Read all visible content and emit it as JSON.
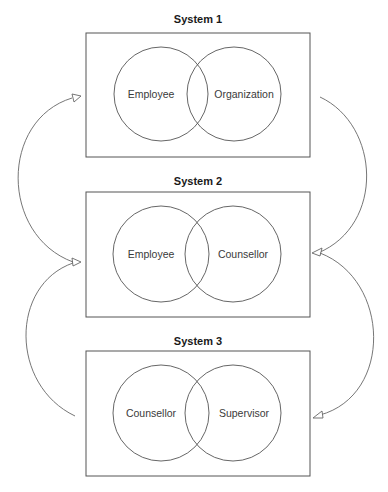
{
  "diagram": {
    "systems": [
      {
        "title": "System 1",
        "left_label": "Employee",
        "right_label": "Organization"
      },
      {
        "title": "System 2",
        "left_label": "Employee",
        "right_label": "Counsellor"
      },
      {
        "title": "System 3",
        "left_label": "Counsellor",
        "right_label": "Supervisor"
      }
    ],
    "connections": [
      {
        "from": "System 1",
        "to": "System 2",
        "side": "right"
      },
      {
        "from": "System 2",
        "to": "System 3",
        "side": "right"
      },
      {
        "from": "System 3",
        "to": "System 2",
        "side": "left"
      },
      {
        "from": "System 2",
        "to": "System 1",
        "side": "left"
      }
    ],
    "colors": {
      "stroke": "#555555",
      "text": "#3a3a3a",
      "title": "#1a1a1a"
    }
  }
}
